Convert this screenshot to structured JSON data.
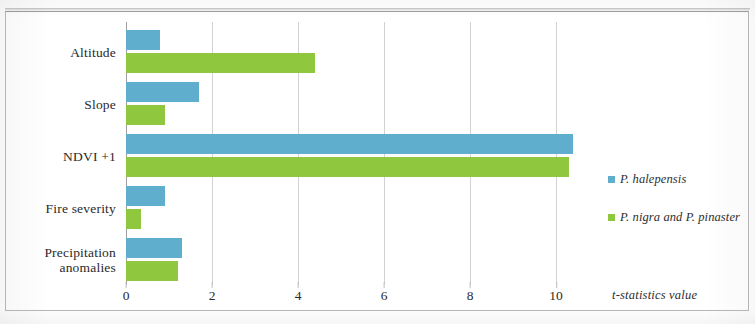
{
  "chart_data": {
    "type": "bar",
    "orientation": "horizontal",
    "title": "",
    "xlabel": "t-statistics value",
    "ylabel": "",
    "categories": [
      "Altitude",
      "Slope",
      "NDVI +1",
      "Fire severity",
      "Precipitation anomalies"
    ],
    "series": [
      {
        "name": "P. halepensis",
        "color": "#5FAECD",
        "values": [
          0.8,
          1.7,
          10.4,
          0.9,
          1.3
        ]
      },
      {
        "name": "P. nigra and P. pinaster",
        "color": "#8FC83F",
        "values": [
          4.4,
          0.9,
          10.3,
          0.35,
          1.2
        ]
      }
    ],
    "xticks": [
      0,
      2,
      4,
      6,
      8,
      10
    ],
    "xlim": [
      0,
      10.6
    ],
    "grid": true,
    "legend_position": "right"
  },
  "axis": {
    "tick_labels": [
      "0",
      "2",
      "4",
      "6",
      "8",
      "10"
    ],
    "title": "t-statistics value"
  },
  "categories": [
    {
      "label": "Altitude"
    },
    {
      "label": "Slope"
    },
    {
      "label": "NDVI +1"
    },
    {
      "label_line1": "Fire severity"
    },
    {
      "label_line1": "Precipitation",
      "label_line2": "anomalies"
    }
  ],
  "legend": {
    "items": [
      {
        "label": "P. halepensis",
        "color": "#5FAECD"
      },
      {
        "label": "P. nigra and P. pinaster",
        "color": "#8FC83F"
      }
    ]
  }
}
